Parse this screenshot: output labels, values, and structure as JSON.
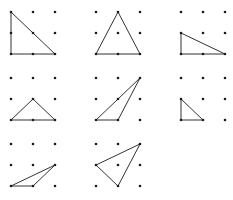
{
  "diagram": {
    "grid_size": 3,
    "colors": {
      "dot": "#1a1a1a",
      "line": "#333333",
      "background": "#ffffff"
    },
    "panels": [
      {
        "id": 1,
        "origin": [
          11,
          12
        ],
        "spacing": [
          22,
          21
        ],
        "triangle": [
          [
            0,
            0
          ],
          [
            0,
            2
          ],
          [
            2,
            2
          ]
        ]
      },
      {
        "id": 2,
        "origin": [
          96,
          12
        ],
        "spacing": [
          22,
          21
        ],
        "triangle": [
          [
            1,
            0
          ],
          [
            0,
            2
          ],
          [
            2,
            2
          ]
        ]
      },
      {
        "id": 3,
        "origin": [
          181,
          12
        ],
        "spacing": [
          22,
          21
        ],
        "triangle": [
          [
            0,
            1
          ],
          [
            0,
            2
          ],
          [
            2,
            2
          ]
        ]
      },
      {
        "id": 4,
        "origin": [
          11,
          78
        ],
        "spacing": [
          22,
          21
        ],
        "triangle": [
          [
            1,
            1
          ],
          [
            0,
            2
          ],
          [
            2,
            2
          ]
        ]
      },
      {
        "id": 5,
        "origin": [
          96,
          78
        ],
        "spacing": [
          22,
          21
        ],
        "triangle": [
          [
            2,
            0
          ],
          [
            0,
            2
          ],
          [
            1,
            2
          ]
        ]
      },
      {
        "id": 6,
        "origin": [
          181,
          78
        ],
        "spacing": [
          22,
          21
        ],
        "triangle": [
          [
            0,
            1
          ],
          [
            0,
            2
          ],
          [
            1,
            2
          ]
        ]
      },
      {
        "id": 7,
        "origin": [
          11,
          144
        ],
        "spacing": [
          22,
          21
        ],
        "triangle": [
          [
            2,
            1
          ],
          [
            0,
            2
          ],
          [
            1,
            2
          ]
        ]
      },
      {
        "id": 8,
        "origin": [
          96,
          144
        ],
        "spacing": [
          22,
          21
        ],
        "triangle": [
          [
            2,
            0
          ],
          [
            0,
            1
          ],
          [
            1,
            2
          ]
        ]
      }
    ]
  }
}
